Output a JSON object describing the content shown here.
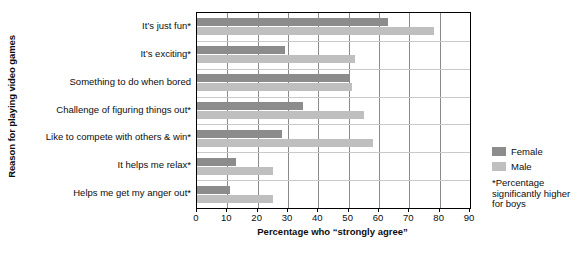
{
  "chart_data": {
    "type": "bar",
    "orientation": "horizontal",
    "title": "",
    "xlabel": "Percentage who “strongly agree”",
    "ylabel": "Reason for playing video games",
    "xlim": [
      0,
      90
    ],
    "xticks": [
      0,
      10,
      20,
      30,
      40,
      50,
      60,
      70,
      80,
      90
    ],
    "xtick_labels": [
      "0",
      "10",
      "20",
      "30",
      "40",
      "50",
      "60",
      "70",
      "80",
      "90"
    ],
    "grid": true,
    "legend_position": "right",
    "categories": [
      "It’s just fun*",
      "It’s exciting*",
      "Something to do when bored",
      "Challenge of figuring things out*",
      "Like to compete with others & win*",
      "It helps me relax*",
      "Helps me get my anger out*"
    ],
    "series": [
      {
        "name": "Female",
        "color": "#8c8c8c",
        "values": [
          63,
          29,
          50,
          35,
          28,
          13,
          11
        ]
      },
      {
        "name": "Male",
        "color": "#bfbfbf",
        "values": [
          78,
          52,
          51,
          55,
          58,
          25,
          25
        ]
      }
    ],
    "annotations": [
      "*Percentage significantly higher for boys"
    ]
  },
  "legend": {
    "items": [
      {
        "label": "Female",
        "color": "#8c8c8c"
      },
      {
        "label": "Male",
        "color": "#bfbfbf"
      }
    ]
  },
  "footnote": {
    "line1": "*Percentage",
    "line2": "significantly higher",
    "line3": "for boys"
  }
}
